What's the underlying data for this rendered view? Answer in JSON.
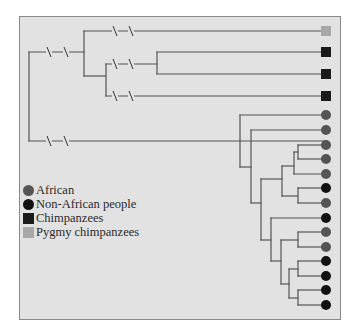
{
  "colors": {
    "panel_bg": "#e2e2e2",
    "branch": "#555555",
    "african": "#555555",
    "non_african": "#111111",
    "chimpanzee": "#1a1a1a",
    "pygmy_chimpanzee": "#a8a8a8"
  },
  "legend": {
    "items": [
      {
        "label": "African",
        "shape": "circle",
        "color": "#555555"
      },
      {
        "label": "Non-African people",
        "shape": "circle",
        "color": "#111111"
      },
      {
        "label": "Chimpanzees",
        "shape": "square",
        "color": "#1a1a1a"
      },
      {
        "label": "Pygmy chimpanzees",
        "shape": "square",
        "color": "#a8a8a8"
      }
    ]
  },
  "tree": {
    "leaves": [
      {
        "group": "pygmy_chimpanzee",
        "shape": "square",
        "y": 31
      },
      {
        "group": "chimpanzee",
        "shape": "square",
        "y": 52
      },
      {
        "group": "chimpanzee",
        "shape": "square",
        "y": 74
      },
      {
        "group": "chimpanzee",
        "shape": "square",
        "y": 96
      },
      {
        "group": "african",
        "shape": "circle",
        "y": 115
      },
      {
        "group": "african",
        "shape": "circle",
        "y": 130
      },
      {
        "group": "african",
        "shape": "circle",
        "y": 145
      },
      {
        "group": "african",
        "shape": "circle",
        "y": 159
      },
      {
        "group": "african",
        "shape": "circle",
        "y": 174
      },
      {
        "group": "non_african",
        "shape": "circle",
        "y": 188
      },
      {
        "group": "african",
        "shape": "circle",
        "y": 203
      },
      {
        "group": "non_african",
        "shape": "circle",
        "y": 218
      },
      {
        "group": "african",
        "shape": "circle",
        "y": 232
      },
      {
        "group": "african",
        "shape": "circle",
        "y": 247
      },
      {
        "group": "non_african",
        "shape": "circle",
        "y": 261
      },
      {
        "group": "non_african",
        "shape": "circle",
        "y": 276
      },
      {
        "group": "non_african",
        "shape": "circle",
        "y": 290
      },
      {
        "group": "non_african",
        "shape": "circle",
        "y": 305
      }
    ],
    "segments": [
      [
        29,
        52,
        29,
        141
      ],
      [
        29,
        52,
        84,
        52
      ],
      [
        29,
        141,
        325,
        141
      ],
      [
        84,
        31,
        84,
        76
      ],
      [
        84,
        31,
        325,
        31
      ],
      [
        84,
        76,
        106,
        76
      ],
      [
        106,
        64,
        106,
        96
      ],
      [
        106,
        64,
        157,
        64
      ],
      [
        106,
        96,
        325,
        96
      ],
      [
        157,
        52,
        157,
        74
      ],
      [
        157,
        52,
        325,
        52
      ],
      [
        157,
        74,
        325,
        74
      ],
      [
        240,
        115,
        240,
        167
      ],
      [
        240,
        115,
        325,
        115
      ],
      [
        240,
        167,
        251,
        167
      ],
      [
        251,
        130,
        251,
        203
      ],
      [
        251,
        130,
        325,
        130
      ],
      [
        251,
        203,
        261,
        203
      ],
      [
        261,
        179,
        261,
        240
      ],
      [
        261,
        179,
        282,
        179
      ],
      [
        261,
        240,
        271,
        240
      ],
      [
        282,
        166,
        282,
        196
      ],
      [
        282,
        166,
        294,
        166
      ],
      [
        282,
        196,
        298,
        196
      ],
      [
        294,
        152,
        294,
        174
      ],
      [
        294,
        152,
        298,
        152
      ],
      [
        294,
        174,
        325,
        174
      ],
      [
        298,
        145,
        298,
        159
      ],
      [
        298,
        145,
        325,
        145
      ],
      [
        298,
        159,
        325,
        159
      ],
      [
        298,
        188,
        298,
        203
      ],
      [
        298,
        188,
        325,
        188
      ],
      [
        298,
        203,
        325,
        203
      ],
      [
        271,
        218,
        271,
        261
      ],
      [
        271,
        218,
        325,
        218
      ],
      [
        271,
        261,
        281,
        261
      ],
      [
        281,
        240,
        281,
        284
      ],
      [
        281,
        240,
        298,
        240
      ],
      [
        281,
        284,
        289,
        284
      ],
      [
        298,
        232,
        298,
        247
      ],
      [
        298,
        232,
        325,
        232
      ],
      [
        298,
        247,
        325,
        247
      ],
      [
        289,
        269,
        289,
        298
      ],
      [
        289,
        269,
        298,
        269
      ],
      [
        289,
        298,
        298,
        298
      ],
      [
        298,
        261,
        298,
        276
      ],
      [
        298,
        261,
        325,
        261
      ],
      [
        298,
        276,
        325,
        276
      ],
      [
        298,
        290,
        298,
        305
      ],
      [
        298,
        290,
        325,
        290
      ],
      [
        298,
        305,
        325,
        305
      ]
    ],
    "breaks": [
      {
        "x": 49,
        "y": 52
      },
      {
        "x": 66,
        "y": 52
      },
      {
        "x": 115,
        "y": 31
      },
      {
        "x": 131,
        "y": 31
      },
      {
        "x": 115,
        "y": 64
      },
      {
        "x": 131,
        "y": 64
      },
      {
        "x": 115,
        "y": 96
      },
      {
        "x": 131,
        "y": 96
      },
      {
        "x": 49,
        "y": 141
      },
      {
        "x": 66,
        "y": 141
      }
    ]
  }
}
